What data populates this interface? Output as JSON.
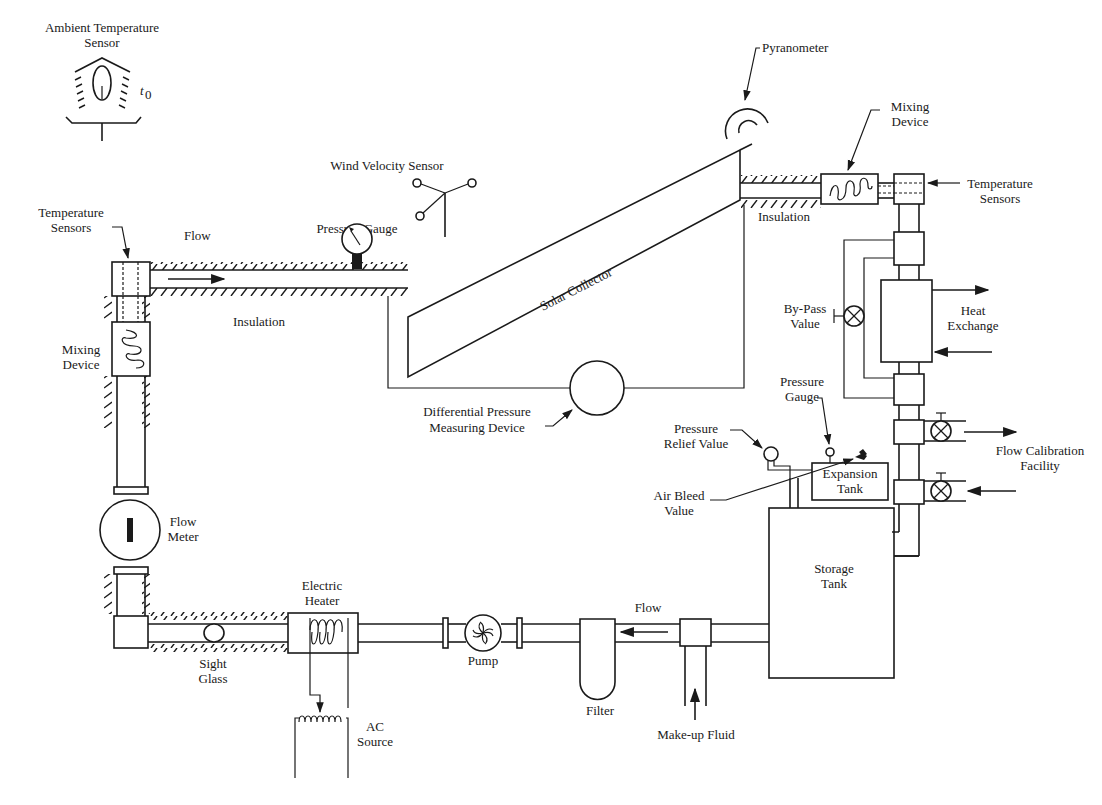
{
  "diagram": {
    "type": "process-schematic",
    "colors": {
      "line": "#1a1a1a",
      "background": "#ffffff"
    },
    "labels": {
      "ambient_sensor": [
        "Ambient Temperature",
        "Sensor"
      ],
      "ambient_symbol": "t",
      "ambient_subscript": "0",
      "pyranometer": "Pyranometer",
      "wind_sensor": "Wind Velocity Sensor",
      "mixing_device_top": [
        "Mixing",
        "Device"
      ],
      "temp_sensors_right": [
        "Temperature",
        "Sensors"
      ],
      "insulation_top": "Insulation",
      "solar_collector": "Solar Collector",
      "temp_sensors_left": [
        "Temperature",
        "Sensors"
      ],
      "flow_top": "Flow",
      "pressure_gauge_top": "Pressure Gauge",
      "insulation_left": "Insulation",
      "mixing_device_left": [
        "Mixing",
        "Device"
      ],
      "diff_pressure": [
        "Differential Pressure",
        "Measuring Device"
      ],
      "bypass_valve": [
        "By-Pass",
        "Value"
      ],
      "heat_exchange": [
        "Heat",
        "Exchange"
      ],
      "pressure_gauge_tank": [
        "Pressure",
        "Gauge"
      ],
      "pressure_relief": [
        "Pressure",
        "Relief Value"
      ],
      "flow_calibration": [
        "Flow Calibration",
        "Facility"
      ],
      "expansion_tank": [
        "Expansion",
        "Tank"
      ],
      "air_bleed": [
        "Air Bleed",
        "Value"
      ],
      "flow_meter": [
        "Flow",
        "Meter"
      ],
      "storage_tank": [
        "Storage",
        "Tank"
      ],
      "electric_heater": [
        "Electric",
        "Heater"
      ],
      "flow_bottom": "Flow",
      "sight_glass": [
        "Sight",
        "Glass"
      ],
      "pump": "Pump",
      "filter": "Filter",
      "ac_source": [
        "AC",
        "Source"
      ],
      "makeup_fluid": "Make-up Fluid"
    },
    "components": [
      "ambient-temperature-sensor",
      "wind-velocity-sensor",
      "pyranometer",
      "solar-collector",
      "mixing-device",
      "temperature-sensors",
      "pressure-gauge",
      "differential-pressure-measuring-device",
      "by-pass-valve",
      "heat-exchanger",
      "flow-calibration-valves",
      "expansion-tank",
      "pressure-relief-valve",
      "air-bleed-valve",
      "storage-tank",
      "make-up-fluid-inlet",
      "filter",
      "pump",
      "electric-heater",
      "ac-source",
      "sight-glass",
      "flow-meter"
    ]
  }
}
